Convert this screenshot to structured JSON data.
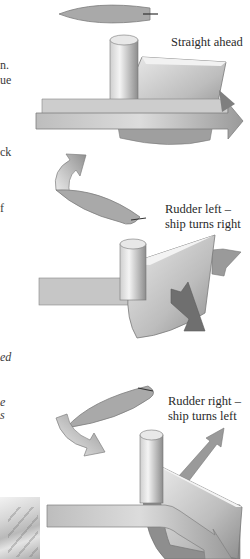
{
  "figure": {
    "panels": [
      {
        "id": "straight",
        "label_lines": [
          "Straight ahead"
        ]
      },
      {
        "id": "rudder-left",
        "label_lines": [
          "Rudder left –",
          "ship turns right"
        ]
      },
      {
        "id": "rudder-right",
        "label_lines": [
          "Rudder right –",
          "ship turns left"
        ]
      }
    ]
  },
  "cropped_text_fragments": [
    {
      "text": "n.",
      "italic": false
    },
    {
      "text": "ue",
      "italic": false
    },
    {
      "text": "ck",
      "italic": false
    },
    {
      "text": "f",
      "italic": false
    },
    {
      "text": "ed",
      "italic": true
    },
    {
      "text": "e",
      "italic": true
    },
    {
      "text": "s",
      "italic": true
    }
  ],
  "colors": {
    "hull": "#9e9e9e",
    "rudder_light": "#e6e6e6",
    "rudder_dark": "#8a8a8a",
    "arrow_dark": "#7a7a7a",
    "background": "#ffffff"
  }
}
